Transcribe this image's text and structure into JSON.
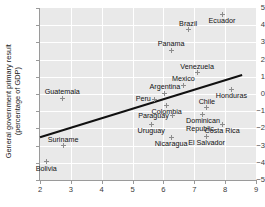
{
  "axes": {
    "ylabel_lines": [
      "General government primary result",
      "(percentage of GDP)"
    ],
    "xlabel": "",
    "xticks": [
      "2",
      "3",
      "4",
      "5",
      "6",
      "7",
      "8",
      "9"
    ],
    "yticks": [
      "5",
      "4",
      "3",
      "2",
      "1",
      "0",
      "-1",
      "-2",
      "-3",
      "-4",
      "-5"
    ],
    "xlim": [
      2,
      9
    ],
    "ylim": [
      -5,
      5
    ],
    "panel_color": "#e9e9e9",
    "grid_color": "#ffffff",
    "marker_color": "#8c8c8c",
    "trend_color": "#111111"
  },
  "chart_data": {
    "type": "scatter",
    "title": "",
    "xlabel": "",
    "ylabel": "General government primary result (percentage of GDP)",
    "xlim": [
      2,
      9
    ],
    "ylim": [
      -5,
      5
    ],
    "grid": true,
    "legend": "none",
    "points": [
      {
        "label": "Ecuador",
        "x": 7.9,
        "y": 4.65,
        "lpos": "below"
      },
      {
        "label": "Brazil",
        "x": 6.8,
        "y": 3.75,
        "lpos": "above"
      },
      {
        "label": "Panama",
        "x": 6.25,
        "y": 2.55,
        "lpos": "above"
      },
      {
        "label": "Venezuela",
        "x": 7.1,
        "y": 1.25,
        "lpos": "above"
      },
      {
        "label": "Mexico",
        "x": 6.65,
        "y": 0.5,
        "lpos": "above"
      },
      {
        "label": "Argentina",
        "x": 6.05,
        "y": 0.05,
        "lpos": "above"
      },
      {
        "label": "Honduras",
        "x": 8.2,
        "y": 0.25,
        "lpos": "below"
      },
      {
        "label": "Guatemala",
        "x": 2.72,
        "y": -0.25,
        "lpos": "above"
      },
      {
        "label": "Peru",
        "x": 5.7,
        "y": -0.3,
        "lpos": "left"
      },
      {
        "label": "Colombia",
        "x": 6.1,
        "y": -0.65,
        "lpos": "below"
      },
      {
        "label": "Chile",
        "x": 7.4,
        "y": -0.8,
        "lpos": "above"
      },
      {
        "label": "Paraguay",
        "x": 6.3,
        "y": -1.25,
        "lpos": "left"
      },
      {
        "label": "Dominican\nRepublic",
        "x": 7.25,
        "y": -1.2,
        "lpos": "below2"
      },
      {
        "label": "Uruguay",
        "x": 5.6,
        "y": -1.75,
        "lpos": "below"
      },
      {
        "label": "Costa Rica",
        "x": 7.9,
        "y": -1.75,
        "lpos": "below"
      },
      {
        "label": "Suriname",
        "x": 2.75,
        "y": -3.0,
        "lpos": "above"
      },
      {
        "label": "Nicaragua",
        "x": 6.25,
        "y": -2.55,
        "lpos": "below"
      },
      {
        "label": "El Salvador",
        "x": 7.4,
        "y": -2.45,
        "lpos": "below"
      },
      {
        "label": "Bolivia",
        "x": 2.2,
        "y": -3.95,
        "lpos": "below"
      }
    ],
    "trend_line": {
      "x0": 2.0,
      "y0": -2.52,
      "x1": 8.55,
      "y1": 1.1
    }
  }
}
